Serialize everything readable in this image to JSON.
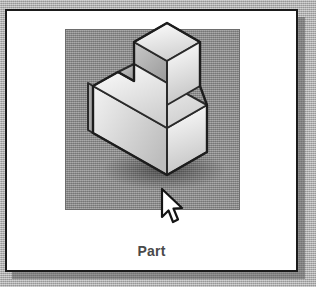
{
  "window": {
    "background_color": "#b5b5b5"
  },
  "card": {
    "border_color": "#1b1b1b",
    "background_color": "#ffffff"
  },
  "preview": {
    "viewport_background_color": "#8e8e8e",
    "icon_name": "isometric-stepped-block-part",
    "description": "Shaded isometric drawing of an L-shaped stepped solid block"
  },
  "caption": {
    "label": "Part"
  },
  "cursor": {
    "icon_name": "arrow-pointer-cursor",
    "x": 155,
    "y": 181
  }
}
